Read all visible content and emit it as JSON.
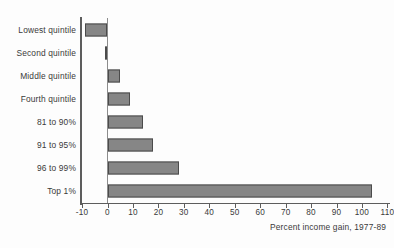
{
  "chart_data": {
    "type": "bar",
    "orientation": "horizontal",
    "title": "",
    "subtitle": "",
    "xlabel": "Percent income gain, 1977-89",
    "ylabel": "",
    "categories": [
      "Lowest quintile",
      "Second quintile",
      "Middle quintile",
      "Fourth quintile",
      "81 to 90%",
      "91 to 95%",
      "96 to 99%",
      "Top 1%"
    ],
    "values": [
      -9,
      -1,
      5,
      9,
      14,
      18,
      28,
      104
    ],
    "xlim": [
      -10,
      110
    ],
    "xticks": [
      -10,
      0,
      10,
      20,
      30,
      40,
      50,
      60,
      70,
      80,
      90,
      100,
      110
    ],
    "xticklabels": [
      "-10",
      "0",
      "10",
      "20",
      "30",
      "40",
      "50",
      "60",
      "70",
      "80",
      "90",
      "100",
      "110"
    ],
    "grid": false,
    "legend": null,
    "bar_color": "#868686",
    "bar_edge_color": "#4b4b4b",
    "axis_color": "#5d5d5d",
    "text_color": "#3a3a3a",
    "background_color": "#fdfdfd"
  },
  "caption": {
    "axis_note": "Percent income gain, 1977-89"
  }
}
